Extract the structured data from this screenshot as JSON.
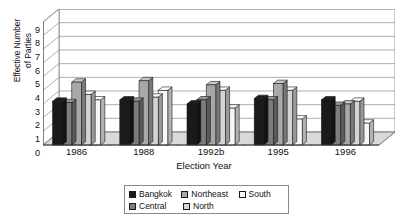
{
  "chart_data": {
    "type": "bar",
    "title": "",
    "xlabel": "Election Year",
    "ylabel_line1": "Effective Number",
    "ylabel_line2": "of Parties",
    "ylabel": "Effective Number of Parties",
    "categories": [
      "1986",
      "1988",
      "1992b",
      "1995",
      "1996"
    ],
    "ylim": [
      0,
      9
    ],
    "yticks": [
      0,
      1,
      2,
      3,
      4,
      5,
      6,
      7,
      8,
      9
    ],
    "ytick_labels": [
      "0",
      "1",
      "2",
      "3",
      "4",
      "5",
      "6",
      "7",
      "8",
      "9"
    ],
    "grid": true,
    "grid_axis": "y",
    "legend_position": "bottom",
    "style": "3d-clustered-column",
    "series": [
      {
        "name": "Bangkok",
        "color": "#1a1a1a",
        "values": [
          3.2,
          3.3,
          3.0,
          3.4,
          3.3
        ]
      },
      {
        "name": "Central",
        "color": "#7d7d7d",
        "values": [
          3.1,
          3.2,
          3.3,
          3.3,
          2.9
        ]
      },
      {
        "name": "Northeast",
        "color": "#a8a8a8",
        "values": [
          4.6,
          4.7,
          4.4,
          4.5,
          3.0
        ]
      },
      {
        "name": "North",
        "color": "#d4d4d4",
        "values": [
          3.7,
          3.5,
          4.0,
          4.0,
          3.2
        ]
      },
      {
        "name": "South",
        "color": "#f7f7f7",
        "values": [
          3.3,
          4.0,
          2.7,
          1.9,
          1.6
        ]
      }
    ]
  },
  "legend": {
    "rows": [
      [
        {
          "label": "Bangkok",
          "series": 0
        },
        {
          "label": "Northeast",
          "series": 2
        },
        {
          "label": "South",
          "series": 4
        }
      ],
      [
        {
          "label": "Central",
          "series": 1
        },
        {
          "label": "North",
          "series": 3
        }
      ]
    ]
  }
}
